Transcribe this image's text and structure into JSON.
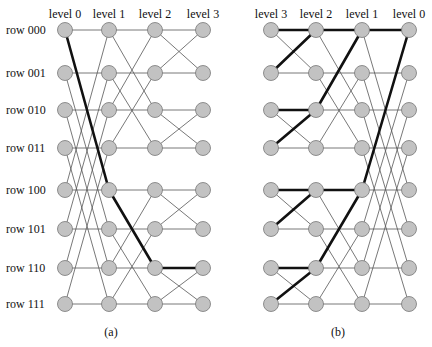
{
  "diagrams": [
    {
      "id": "a",
      "caption": "(a)",
      "level_labels": [
        "level 0",
        "level 1",
        "level 2",
        "level 3"
      ],
      "column_x": [
        65,
        109,
        155,
        203
      ],
      "caption_x": 111,
      "row_labels": [
        "row 000",
        "row 001",
        "row 010",
        "row 011",
        "row 100",
        "row 101",
        "row 110",
        "row 111"
      ],
      "stage_xor": [
        4,
        2,
        1
      ],
      "thick_path": [
        [
          0,
          0
        ],
        [
          1,
          4
        ],
        [
          2,
          6
        ],
        [
          3,
          6
        ]
      ]
    },
    {
      "id": "b",
      "caption": "(b)",
      "level_labels": [
        "level 3",
        "level 2",
        "level 1",
        "level 0"
      ],
      "column_x": [
        271,
        316,
        362,
        409
      ],
      "caption_x": 338,
      "row_labels": [],
      "stage_xor": [
        1,
        2,
        4
      ],
      "thick_edges": [
        [
          0,
          0,
          1,
          0
        ],
        [
          0,
          1,
          1,
          0
        ],
        [
          0,
          2,
          1,
          2
        ],
        [
          0,
          3,
          1,
          2
        ],
        [
          0,
          4,
          1,
          4
        ],
        [
          0,
          5,
          1,
          4
        ],
        [
          0,
          6,
          1,
          6
        ],
        [
          0,
          7,
          1,
          6
        ],
        [
          1,
          0,
          2,
          0
        ],
        [
          1,
          2,
          2,
          0
        ],
        [
          1,
          4,
          2,
          4
        ],
        [
          1,
          6,
          2,
          4
        ],
        [
          2,
          0,
          3,
          0
        ],
        [
          2,
          4,
          3,
          0
        ]
      ]
    }
  ],
  "row_y": [
    30,
    73,
    110,
    148,
    190,
    229,
    268,
    304
  ],
  "style": {
    "node_fill": "#c2c2c2",
    "edge_color": "#555555",
    "path_color": "#111111"
  }
}
